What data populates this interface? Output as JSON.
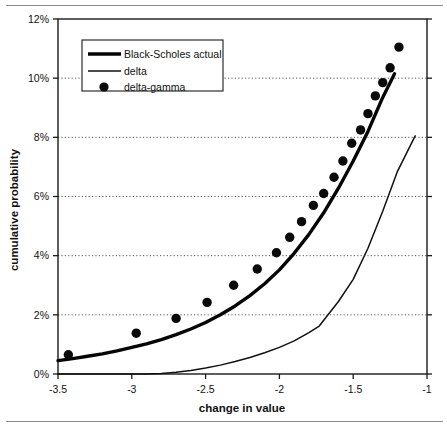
{
  "chart_data": {
    "type": "line",
    "title": "",
    "xlabel": "change in value",
    "ylabel": "cumulative probability",
    "xlim": [
      -3.5,
      -1.0
    ],
    "ylim": [
      0,
      12
    ],
    "xticks": [
      -3.5,
      -3,
      -2.5,
      -2,
      -1.5,
      -1
    ],
    "xtick_labels": [
      "-3.5",
      "-3",
      "-2.5",
      "-2",
      "-1.5",
      "-1"
    ],
    "yticks": [
      0,
      2,
      4,
      6,
      8,
      10,
      12
    ],
    "ytick_labels": [
      "0%",
      "2%",
      "4%",
      "6%",
      "8%",
      "10%",
      "12%"
    ],
    "grid": "horizontal-dotted",
    "legend_position": "upper-left-inside",
    "legend": [
      {
        "label": "Black-Scholes actual",
        "marker": "thick-line"
      },
      {
        "label": "delta",
        "marker": "thin-line"
      },
      {
        "label": "delta-gamma",
        "marker": "filled-circle"
      }
    ],
    "series": [
      {
        "name": "Black-Scholes actual",
        "style": "thick-line",
        "x": [
          -3.5,
          -3.4,
          -3.3,
          -3.2,
          -3.1,
          -3.0,
          -2.9,
          -2.8,
          -2.7,
          -2.6,
          -2.5,
          -2.4,
          -2.3,
          -2.2,
          -2.1,
          -2.0,
          -1.9,
          -1.8,
          -1.7,
          -1.6,
          -1.5,
          -1.4,
          -1.3,
          -1.22
        ],
        "y": [
          0.45,
          0.52,
          0.6,
          0.68,
          0.78,
          0.9,
          1.02,
          1.16,
          1.33,
          1.52,
          1.74,
          2.0,
          2.3,
          2.65,
          3.05,
          3.52,
          4.08,
          4.72,
          5.45,
          6.28,
          7.2,
          8.2,
          9.35,
          10.15
        ]
      },
      {
        "name": "delta",
        "style": "thin-line",
        "x": [
          -3.5,
          -3.2,
          -3.0,
          -2.9,
          -2.8,
          -2.7,
          -2.6,
          -2.5,
          -2.4,
          -2.3,
          -2.2,
          -2.1,
          -2.0,
          -1.9,
          -1.8,
          -1.73,
          -1.6,
          -1.5,
          -1.4,
          -1.3,
          -1.2,
          -1.08
        ],
        "y": [
          0.0,
          0.0,
          0.0,
          0.0,
          0.02,
          0.06,
          0.12,
          0.2,
          0.3,
          0.42,
          0.56,
          0.72,
          0.9,
          1.12,
          1.4,
          1.62,
          2.45,
          3.2,
          4.25,
          5.5,
          6.85,
          8.05
        ]
      },
      {
        "name": "delta-gamma",
        "style": "filled-circle",
        "x": [
          -3.43,
          -2.97,
          -2.7,
          -2.49,
          -2.31,
          -2.15,
          -2.02,
          -1.93,
          -1.85,
          -1.77,
          -1.7,
          -1.63,
          -1.57,
          -1.51,
          -1.45,
          -1.4,
          -1.35,
          -1.3,
          -1.25,
          -1.19
        ],
        "y": [
          0.65,
          1.38,
          1.88,
          2.42,
          3.0,
          3.55,
          4.1,
          4.62,
          5.15,
          5.7,
          6.1,
          6.65,
          7.2,
          7.8,
          8.25,
          8.8,
          9.4,
          9.85,
          10.35,
          11.05
        ]
      }
    ]
  }
}
